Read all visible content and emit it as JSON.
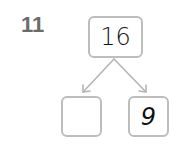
{
  "question": {
    "number": "11"
  },
  "number_bond": {
    "whole": "16",
    "parts": [
      {
        "value": ""
      },
      {
        "value": "9"
      }
    ]
  },
  "colors": {
    "box_border": "#bdbdbd",
    "arrow": "#b5b5b5",
    "number_label": "#6b6b6b"
  }
}
